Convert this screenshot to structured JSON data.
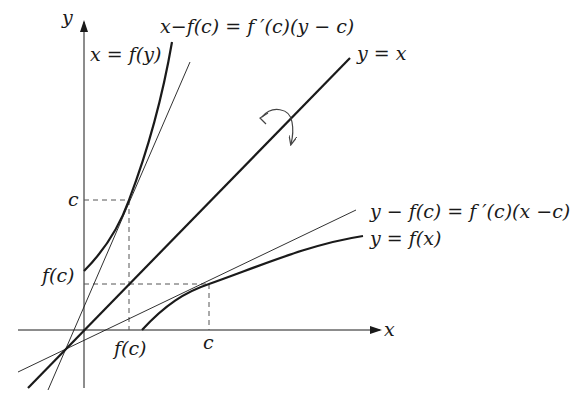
{
  "diagram": {
    "axes": {
      "x_label": "x",
      "y_label": "y"
    },
    "labels": {
      "inverse_curve": "x = f(y)",
      "inverse_tangent": "x−f(c) = f ′(c)(y − c)",
      "diagonal": "y = x",
      "tangent": "y − f(c) = f ′(c)(x −c)",
      "curve": "y = f(x)",
      "y_tick_c": "c",
      "y_tick_fc": "f(c)",
      "x_tick_fc": "f(c)",
      "x_tick_c": "c"
    },
    "colors": {
      "ink": "#1a1a1a",
      "dashed": "#555555",
      "arrow": "#444444"
    }
  }
}
